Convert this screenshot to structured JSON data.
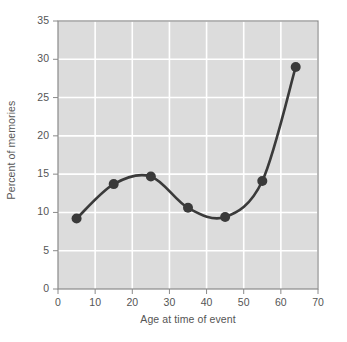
{
  "chart_data": {
    "type": "line",
    "title": "",
    "subtitle": "",
    "xlabel": "Age at time of event",
    "ylabel": "Percent of memories",
    "x": [
      5,
      15,
      25,
      35,
      45,
      55,
      64
    ],
    "values": [
      9.2,
      13.7,
      14.7,
      10.6,
      9.4,
      14.1,
      29.0
    ],
    "series": [
      {
        "name": "Percent of memories",
        "x": [
          5,
          15,
          25,
          35,
          45,
          55,
          64
        ],
        "values": [
          9.2,
          13.7,
          14.7,
          10.6,
          9.4,
          14.1,
          29.0
        ]
      }
    ],
    "xlim": [
      0,
      70
    ],
    "ylim": [
      0,
      35
    ],
    "xticks": [
      0,
      10,
      20,
      30,
      40,
      50,
      60,
      70
    ],
    "yticks": [
      0,
      5,
      10,
      15,
      20,
      25,
      30,
      35
    ],
    "xtick_labels": [
      "0",
      "10",
      "20",
      "30",
      "40",
      "50",
      "60",
      "70"
    ],
    "ytick_labels": [
      "0",
      "5",
      "10",
      "15",
      "20",
      "25",
      "30",
      "35"
    ],
    "grid": true,
    "grid_color": "#ffffff",
    "plot_background": "#dcdcdc",
    "legend": null,
    "legend_position": "none",
    "marker": "circle",
    "marker_color": "#3a3a3a",
    "line_color": "#3a3a3a",
    "line_smoothing": "spline",
    "annotations": []
  },
  "axis_style": {
    "tick_color": "#8a8a8a",
    "axis_color": "#8a8a8a",
    "label_color": "#555555"
  }
}
